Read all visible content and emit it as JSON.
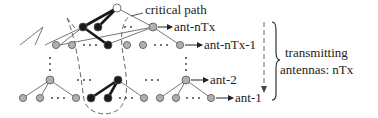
{
  "labels": {
    "critical_path": "critical path",
    "ant_ntx": "ant-nTx",
    "ant_ntx_1": "ant-nTx-1",
    "ant_2": "ant-2",
    "ant_1": "ant-1",
    "brace_line1": "transmitting",
    "brace_line2": "antennas: nTx",
    "ellipsis": "· · ·",
    "vdots": "⋮"
  },
  "colors": {
    "critical_node": "#1a1a1a",
    "normal_node": "#b0b0b0",
    "root_node": "#ffffff",
    "edge_normal": "#777777",
    "edge_critical": "#1a1a1a",
    "dashed": "#666666"
  }
}
